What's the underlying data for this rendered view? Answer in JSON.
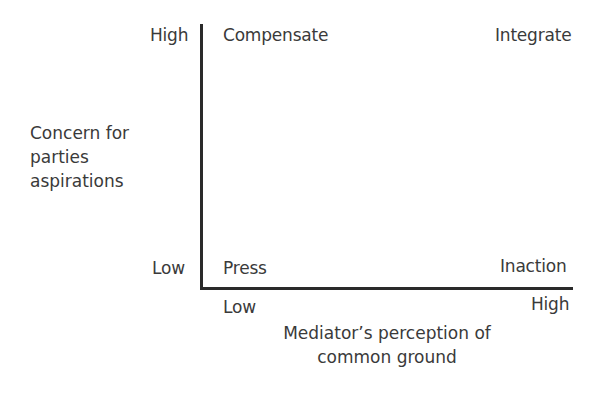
{
  "diagram": {
    "type": "2x2 matrix",
    "y_axis": {
      "label_lines": [
        "Concern for",
        "parties",
        "aspirations"
      ],
      "high": "High",
      "low": "Low"
    },
    "x_axis": {
      "label_lines": [
        "Mediator’s perception of",
        "common ground"
      ],
      "low": "Low",
      "high": "High"
    },
    "quadrants": {
      "top_left": "Compensate",
      "top_right": "Integrate",
      "bottom_left": "Press",
      "bottom_right": "Inaction"
    },
    "colors": {
      "text": "#3a3a3a",
      "axis": "#2a2a2a",
      "background": "#ffffff"
    }
  }
}
